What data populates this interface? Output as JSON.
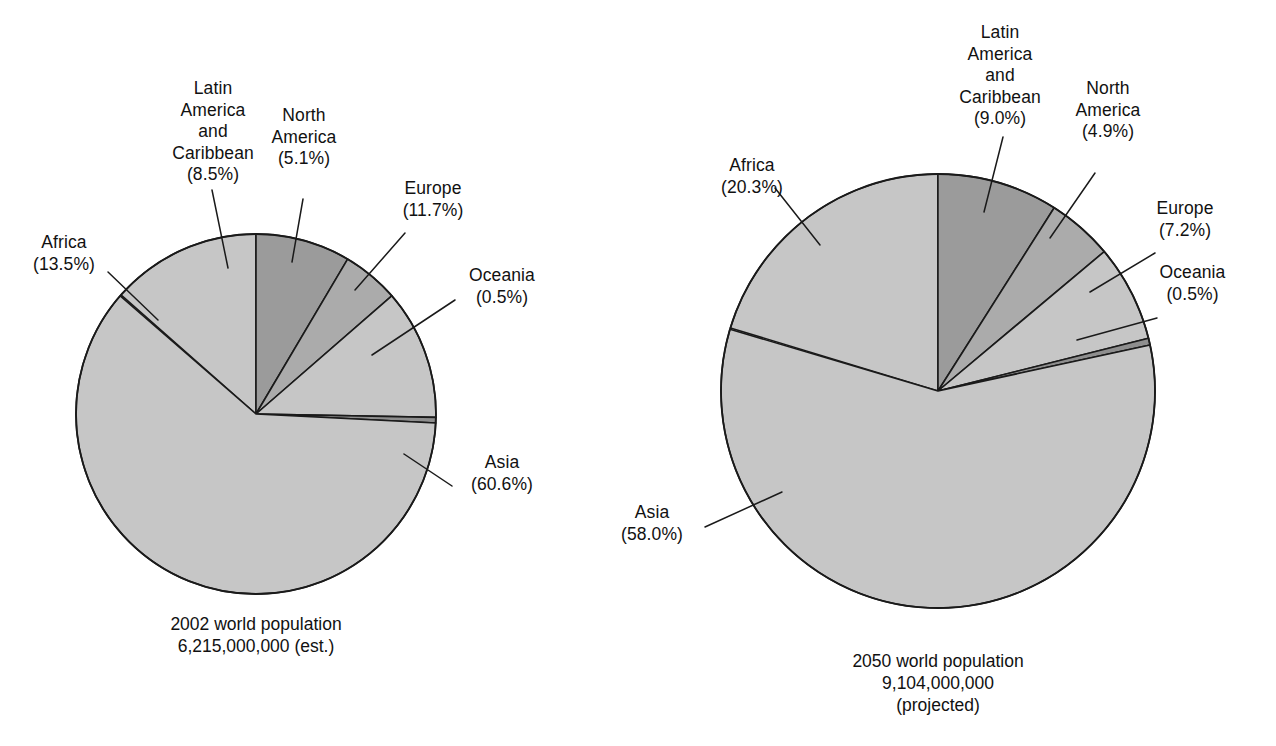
{
  "chart_data": [
    {
      "type": "pie",
      "title": "2002 world population",
      "subtitle": "6,215,000,000 (est.)",
      "caption_lines": [
        "2002 world population",
        "6,215,000,000 (est.)"
      ],
      "total_population": "6,215,000,000",
      "total_note": "(est.)",
      "year": "2002",
      "categories": [
        "Africa",
        "Latin America and Caribbean",
        "North America",
        "Europe",
        "Oceania",
        "Asia"
      ],
      "values": [
        13.5,
        8.5,
        5.1,
        11.7,
        0.5,
        60.6
      ],
      "unit": "percent",
      "legend": "none",
      "grid": false,
      "slices": [
        {
          "label": "Africa",
          "label_lines": [
            "Africa",
            "(13.5%)"
          ],
          "value": 13.5,
          "pct_text": "(13.5%)",
          "shade": "#c6c6c6"
        },
        {
          "label": "Latin America and Caribbean",
          "label_lines": [
            "Latin",
            "America",
            "and",
            "Caribbean",
            "(8.5%)"
          ],
          "value": 8.5,
          "pct_text": "(8.5%)",
          "shade": "#9b9b9b"
        },
        {
          "label": "North America",
          "label_lines": [
            "North",
            "America",
            "(5.1%)"
          ],
          "value": 5.1,
          "pct_text": "(5.1%)",
          "shade": "#ababab"
        },
        {
          "label": "Europe",
          "label_lines": [
            "Europe",
            "(11.7%)"
          ],
          "value": 11.7,
          "pct_text": "(11.7%)",
          "shade": "#c6c6c6"
        },
        {
          "label": "Oceania",
          "label_lines": [
            "Oceania",
            "(0.5%)"
          ],
          "value": 0.5,
          "pct_text": "(0.5%)",
          "shade": "#8e8e8e"
        },
        {
          "label": "Asia",
          "label_lines": [
            "Asia",
            "(60.6%)"
          ],
          "value": 60.6,
          "pct_text": "(60.6%)",
          "shade": "#c6c6c6"
        }
      ]
    },
    {
      "type": "pie",
      "title": "2050 world population",
      "subtitle": "9,104,000,000 (projected)",
      "caption_lines": [
        "2050 world population",
        "9,104,000,000",
        "(projected)"
      ],
      "total_population": "9,104,000,000",
      "total_note": "(projected)",
      "year": "2050",
      "categories": [
        "Africa",
        "Latin America and Caribbean",
        "North America",
        "Europe",
        "Oceania",
        "Asia"
      ],
      "values": [
        20.3,
        9.0,
        4.9,
        7.2,
        0.5,
        58.0
      ],
      "unit": "percent",
      "legend": "none",
      "grid": false,
      "slices": [
        {
          "label": "Africa",
          "label_lines": [
            "Africa",
            "(20.3%)"
          ],
          "value": 20.3,
          "pct_text": "(20.3%)",
          "shade": "#c6c6c6"
        },
        {
          "label": "Latin America and Caribbean",
          "label_lines": [
            "Latin",
            "America",
            "and",
            "Caribbean",
            "(9.0%)"
          ],
          "value": 9.0,
          "pct_text": "(9.0%)",
          "shade": "#9b9b9b"
        },
        {
          "label": "North America",
          "label_lines": [
            "North",
            "America",
            "(4.9%)"
          ],
          "value": 4.9,
          "pct_text": "(4.9%)",
          "shade": "#ababab"
        },
        {
          "label": "Europe",
          "label_lines": [
            "Europe",
            "(7.2%)"
          ],
          "value": 7.2,
          "pct_text": "(7.2%)",
          "shade": "#c6c6c6"
        },
        {
          "label": "Oceania",
          "label_lines": [
            "Oceania",
            "(0.5%)"
          ],
          "value": 0.5,
          "pct_text": "(0.5%)",
          "shade": "#8e8e8e"
        },
        {
          "label": "Asia",
          "label_lines": [
            "Asia",
            "(58.0%)"
          ],
          "value": 58.0,
          "pct_text": "(58.0%)",
          "shade": "#c6c6c6"
        }
      ]
    }
  ],
  "left_chart": {
    "labels": {
      "latin_america": "Latin\nAmerica\nand\nCaribbean\n(8.5%)",
      "north_america": "North\nAmerica\n(5.1%)",
      "africa": "Africa\n(13.5%)",
      "europe": "Europe\n(11.7%)",
      "oceania": "Oceania\n(0.5%)",
      "asia": "Asia\n(60.6%)"
    },
    "caption": "2002 world population\n6,215,000,000 (est.)"
  },
  "right_chart": {
    "labels": {
      "latin_america": "Latin\nAmerica\nand\nCaribbean\n(9.0%)",
      "north_america": "North\nAmerica\n(4.9%)",
      "africa": "Africa\n(20.3%)",
      "europe": "Europe\n(7.2%)",
      "oceania": "Oceania\n(0.5%)",
      "asia": "Asia\n(58.0%)"
    },
    "caption": "2050 world population\n9,104,000,000\n(projected)"
  },
  "colors": {
    "slice_light": "#c6c6c6",
    "slice_medium": "#ababab",
    "slice_dark": "#9b9b9b",
    "slice_oceania": "#8e8e8e",
    "stroke": "#1a1a1a",
    "text": "#111111",
    "background": "#ffffff"
  }
}
